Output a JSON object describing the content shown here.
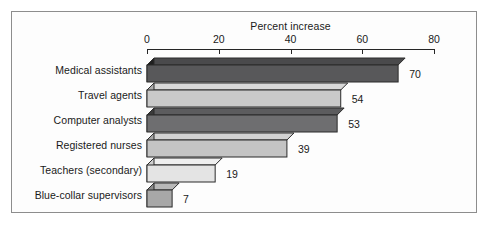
{
  "chart_data": {
    "type": "bar",
    "orientation": "horizontal",
    "title": "",
    "xlabel": "Percent increase",
    "ylabel": "",
    "xlim": [
      0,
      80
    ],
    "xticks": [
      0,
      20,
      40,
      60,
      80
    ],
    "xtick_labels": [
      "0",
      "20",
      "40",
      "60",
      "80"
    ],
    "grid": false,
    "legend": null,
    "categories": [
      "Medical assistants",
      "Travel agents",
      "Computer analysts",
      "Registered nurses",
      "Teachers (secondary)",
      "Blue-collar supervisors"
    ],
    "values": [
      70,
      54,
      53,
      39,
      19,
      7
    ],
    "value_labels": [
      "70",
      "54",
      "53",
      "39",
      "19",
      "7"
    ],
    "bar_colors": [
      "#58585a",
      "#c9c9c9",
      "#6e6e70",
      "#c4c4c4",
      "#e4e4e4",
      "#a8a8a8"
    ],
    "bar_side_colors": [
      "#1f1f1f",
      "#adadad",
      "#3a3a3a",
      "#a6a6a6",
      "#cfcfcf",
      "#8c8c8c"
    ],
    "bar_top_colors": [
      "#4a4a4c",
      "#d8d8d8",
      "#5c5c5e",
      "#d2d2d2",
      "#efefef",
      "#b8b8b8"
    ],
    "style": "3d-horizontal-bars",
    "frame_color": "#8d8d8d",
    "axis_color": "#262626",
    "background": "#fdfdfd"
  }
}
